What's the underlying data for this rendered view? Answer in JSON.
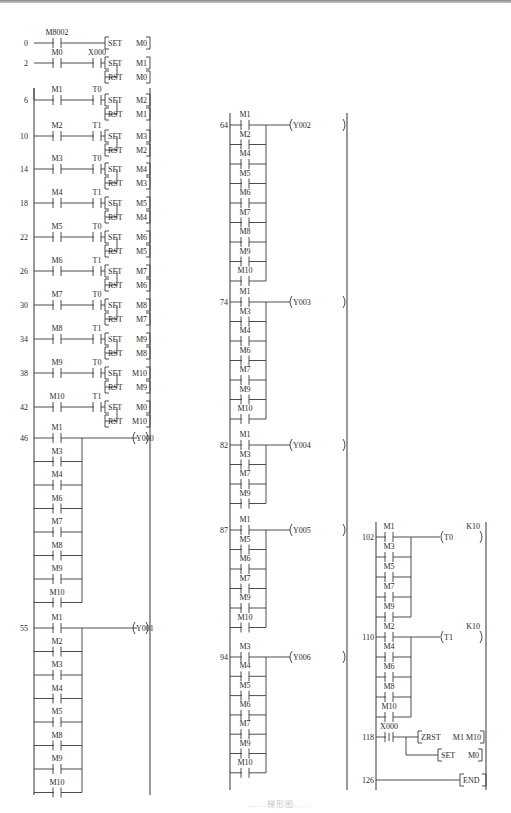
{
  "figure": {
    "type": "PLC ladder diagram",
    "caption": "……梯形图……"
  },
  "columns": [
    {
      "rungs": [
        {
          "step": "0",
          "contacts": [
            [
              "M8002"
            ]
          ],
          "outputs": [
            {
              "kind": "instr",
              "op": "SET",
              "arg": "M0"
            }
          ]
        },
        {
          "step": "2",
          "contacts": [
            [
              "M0",
              "X000"
            ]
          ],
          "outputs": [
            {
              "kind": "instr",
              "op": "SET",
              "arg": "M1"
            },
            {
              "kind": "instr",
              "op": "RST",
              "arg": "M0"
            }
          ]
        },
        {
          "step": "6",
          "contacts": [
            [
              "M1",
              "T0"
            ]
          ],
          "outputs": [
            {
              "kind": "instr",
              "op": "SET",
              "arg": "M2"
            },
            {
              "kind": "instr",
              "op": "RST",
              "arg": "M1"
            }
          ]
        },
        {
          "step": "10",
          "contacts": [
            [
              "M2",
              "T1"
            ]
          ],
          "outputs": [
            {
              "kind": "instr",
              "op": "SET",
              "arg": "M3"
            },
            {
              "kind": "instr",
              "op": "RST",
              "arg": "M2"
            }
          ]
        },
        {
          "step": "14",
          "contacts": [
            [
              "M3",
              "T0"
            ]
          ],
          "outputs": [
            {
              "kind": "instr",
              "op": "SET",
              "arg": "M4"
            },
            {
              "kind": "instr",
              "op": "RST",
              "arg": "M3"
            }
          ]
        },
        {
          "step": "18",
          "contacts": [
            [
              "M4",
              "T1"
            ]
          ],
          "outputs": [
            {
              "kind": "instr",
              "op": "SET",
              "arg": "M5"
            },
            {
              "kind": "instr",
              "op": "RST",
              "arg": "M4"
            }
          ]
        },
        {
          "step": "22",
          "contacts": [
            [
              "M5",
              "T0"
            ]
          ],
          "outputs": [
            {
              "kind": "instr",
              "op": "SET",
              "arg": "M6"
            },
            {
              "kind": "instr",
              "op": "RST",
              "arg": "M5"
            }
          ]
        },
        {
          "step": "26",
          "contacts": [
            [
              "M6",
              "T1"
            ]
          ],
          "outputs": [
            {
              "kind": "instr",
              "op": "SET",
              "arg": "M7"
            },
            {
              "kind": "instr",
              "op": "RST",
              "arg": "M6"
            }
          ]
        },
        {
          "step": "30",
          "contacts": [
            [
              "M7",
              "T0"
            ]
          ],
          "outputs": [
            {
              "kind": "instr",
              "op": "SET",
              "arg": "M8"
            },
            {
              "kind": "instr",
              "op": "RST",
              "arg": "M7"
            }
          ]
        },
        {
          "step": "34",
          "contacts": [
            [
              "M8",
              "T1"
            ]
          ],
          "outputs": [
            {
              "kind": "instr",
              "op": "SET",
              "arg": "M9"
            },
            {
              "kind": "instr",
              "op": "RST",
              "arg": "M8"
            }
          ]
        },
        {
          "step": "38",
          "contacts": [
            [
              "M9",
              "T0"
            ]
          ],
          "outputs": [
            {
              "kind": "instr",
              "op": "SET",
              "arg": "M10"
            },
            {
              "kind": "instr",
              "op": "RST",
              "arg": "M9"
            }
          ]
        },
        {
          "step": "42",
          "contacts": [
            [
              "M10",
              "T1"
            ]
          ],
          "outputs": [
            {
              "kind": "instr",
              "op": "SET",
              "arg": "M0"
            },
            {
              "kind": "instr",
              "op": "RST",
              "arg": "M10"
            }
          ]
        },
        {
          "step": "46",
          "parallel": [
            "M1",
            "M3",
            "M4",
            "M6",
            "M7",
            "M8",
            "M9",
            "M10"
          ],
          "outputs": [
            {
              "kind": "coil",
              "arg": "Y000"
            }
          ]
        },
        {
          "step": "55",
          "parallel": [
            "M1",
            "M2",
            "M3",
            "M4",
            "M5",
            "M8",
            "M9",
            "M10"
          ],
          "outputs": [
            {
              "kind": "coil",
              "arg": "Y001"
            }
          ]
        }
      ]
    },
    {
      "rungs": [
        {
          "step": "64",
          "parallel": [
            "M1",
            "M2",
            "M4",
            "M5",
            "M6",
            "M7",
            "M8",
            "M9",
            "M10"
          ],
          "outputs": [
            {
              "kind": "coil",
              "arg": "Y002"
            }
          ]
        },
        {
          "step": "74",
          "parallel": [
            "M1",
            "M3",
            "M4",
            "M6",
            "M7",
            "M9",
            "M10"
          ],
          "outputs": [
            {
              "kind": "coil",
              "arg": "Y003"
            }
          ]
        },
        {
          "step": "82",
          "parallel": [
            "M1",
            "M3",
            "M7",
            "M9"
          ],
          "outputs": [
            {
              "kind": "coil",
              "arg": "Y004"
            }
          ]
        },
        {
          "step": "87",
          "parallel": [
            "M1",
            "M5",
            "M6",
            "M7",
            "M9",
            "M10"
          ],
          "outputs": [
            {
              "kind": "coil",
              "arg": "Y005"
            }
          ]
        },
        {
          "step": "94",
          "parallel": [
            "M3",
            "M4",
            "M5",
            "M6",
            "M7",
            "M9",
            "M10"
          ],
          "outputs": [
            {
              "kind": "coil",
              "arg": "Y006"
            }
          ]
        }
      ]
    },
    {
      "rungs": [
        {
          "step": "102",
          "parallel": [
            "M1",
            "M3",
            "M5",
            "M7",
            "M9"
          ],
          "outputs": [
            {
              "kind": "coil",
              "arg": "T0",
              "preset": "K10"
            }
          ]
        },
        {
          "step": "110",
          "parallel": [
            "M2",
            "M4",
            "M6",
            "M8",
            "M10"
          ],
          "outputs": [
            {
              "kind": "coil",
              "arg": "T1",
              "preset": "K10"
            }
          ]
        },
        {
          "step": "118",
          "contacts": [
            [
              "X000"
            ]
          ],
          "pulse": true,
          "outputs": [
            {
              "kind": "instr",
              "op": "ZRST",
              "arg": "M1 M10"
            },
            {
              "kind": "instr",
              "op": "SET",
              "arg": "M0"
            }
          ]
        },
        {
          "step": "126",
          "contacts": [],
          "outputs": [
            {
              "kind": "instr",
              "op": "END",
              "arg": ""
            }
          ]
        }
      ]
    }
  ]
}
